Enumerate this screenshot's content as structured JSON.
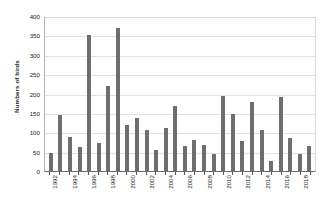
{
  "chart_data": {
    "type": "bar",
    "title": "",
    "xlabel": "",
    "ylabel": "Numbers of birds",
    "ylim": [
      0,
      400
    ],
    "ytick_step": 50,
    "yticks": [
      400,
      350,
      300,
      250,
      200,
      150,
      100,
      50,
      0
    ],
    "grid": true,
    "legend": "none",
    "bar_color": "#6e6e6e",
    "gridline_color": "#e2e2e2",
    "axis_color": "#6b6b6b",
    "label_rotation_deg": 90,
    "tick_label_interval": 2,
    "categories": [
      "1992",
      "1993",
      "1994",
      "1995",
      "1996",
      "1997",
      "1998",
      "1999",
      "2000",
      "2001",
      "2002",
      "2003",
      "2004",
      "2005",
      "2006",
      "2007",
      "2008",
      "2009",
      "2010",
      "2011",
      "2012",
      "2013",
      "2014",
      "2015",
      "2016",
      "2017",
      "2018",
      "2019"
    ],
    "visible_tick_labels": [
      "1992",
      "",
      "1994",
      "",
      "1996",
      "",
      "1998",
      "",
      "2000",
      "",
      "2002",
      "",
      "2004",
      "",
      "2006",
      "",
      "2008",
      "",
      "2010",
      "",
      "2012",
      "",
      "2014",
      "",
      "2016",
      "",
      "2018",
      ""
    ],
    "values": [
      47,
      144,
      89,
      62,
      351,
      72,
      219,
      369,
      120,
      137,
      105,
      54,
      110,
      168,
      65,
      80,
      68,
      45,
      193,
      148,
      78,
      179,
      105,
      26,
      190,
      86,
      45,
      64
    ]
  }
}
